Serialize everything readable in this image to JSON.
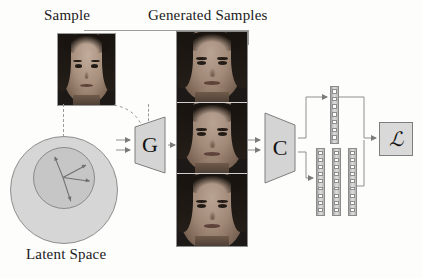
{
  "figure": {
    "background_color": "#fdfdfc"
  },
  "labels": {
    "sample": "Sample",
    "generated_samples": "Generated Samples",
    "latent_space": "Latent Space"
  },
  "blocks": {
    "generator": {
      "glyph": "G",
      "name": "generator"
    },
    "classifier": {
      "glyph": "C",
      "name": "classifier"
    },
    "loss": {
      "glyph": "ℒ",
      "name": "loss"
    }
  },
  "latent": {
    "outer_fill": "#d6d6d6",
    "inner_fill": "#c6c6c6",
    "stroke": "#8e8e8e",
    "ray_count": 4,
    "ray_angles_deg": [
      -112,
      -28,
      8,
      72
    ],
    "ray_lengths": [
      22,
      26,
      27,
      25
    ]
  },
  "generated": {
    "count": 3,
    "cells": [
      "generated-face-1",
      "generated-face-2",
      "generated-face-3"
    ]
  },
  "feature_bars": {
    "top": {
      "name": "feature-vector-top",
      "cells": 7
    },
    "bottom": [
      {
        "name": "feature-vector-bottom-1",
        "cells": 9
      },
      {
        "name": "feature-vector-bottom-2",
        "cells": 9
      },
      {
        "name": "feature-vector-bottom-3",
        "cells": 9
      }
    ]
  },
  "colors": {
    "line": "#8f8f8f",
    "dashed": "#9b9b9b",
    "trapezoid_fill": "#d4d4d4",
    "trapezoid_stroke": "#7f7f7f",
    "text": "#1a1a1a"
  }
}
